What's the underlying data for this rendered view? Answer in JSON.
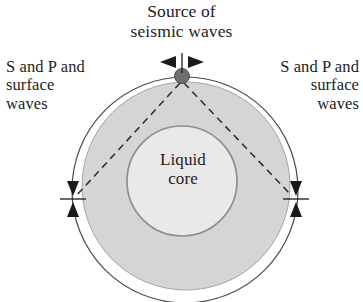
{
  "figure": {
    "name": "earth-seismic-shadow-zone-diagram",
    "background_color": "#ffffff",
    "width": 363,
    "height": 302
  },
  "labels": {
    "title": "Source of\nseismic waves",
    "left_waves": "S and P and\nsurface\nwaves",
    "right_waves": "S and P and\nsurface\nwaves",
    "core": "Liquid\ncore"
  },
  "colors": {
    "mantle_fill": "#d5d5d5",
    "mantle_stroke": "#9a9a9a",
    "core_fill": "#e9e9e9",
    "core_stroke": "#8e8e8e",
    "surface_stroke": "#4a4a4a",
    "source_dot": "#6e6e6e",
    "source_dot_stroke": "#4f4f4f",
    "ray_stroke": "#2a2a2a",
    "arrow_fill": "#1a1a1a",
    "text": "#1d1d1d"
  },
  "geometry": {
    "surface_circle": {
      "cx": 185,
      "cy": 190,
      "r": 113
    },
    "mantle_circle": {
      "cx": 186,
      "cy": 186,
      "r": 104
    },
    "core_circle": {
      "cx": 182,
      "cy": 181,
      "r": 55
    },
    "source_point": {
      "cx": 182,
      "cy": 76,
      "r": 7
    },
    "ray_left_end": {
      "x": 76,
      "y": 196
    },
    "ray_right_end": {
      "x": 292,
      "y": 196
    },
    "dash_pattern": "7 5"
  },
  "markers": [
    {
      "name": "source-marker",
      "x": 182,
      "y": 62,
      "orientation": "horizontal"
    },
    {
      "name": "left-shadow-marker",
      "x": 73,
      "y": 199,
      "orientation": "vertical"
    },
    {
      "name": "right-shadow-marker",
      "x": 296,
      "y": 199,
      "orientation": "vertical"
    }
  ]
}
